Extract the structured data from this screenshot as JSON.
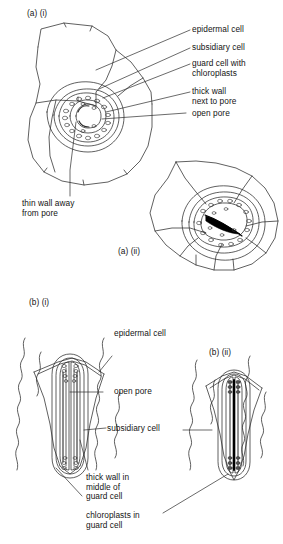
{
  "figure": {
    "panels": [
      {
        "id": "a-i",
        "code": "(a)  (i)",
        "state": "open",
        "view": "surface view of open stoma"
      },
      {
        "id": "a-ii",
        "code": "(a) (ii)",
        "state": "closed",
        "view": "surface view of closed stoma"
      },
      {
        "id": "b-i",
        "code": "(b)  (i)",
        "state": "open",
        "view": "cross-section / plan of open stoma"
      },
      {
        "id": "b-ii",
        "code": "(b)  (ii)",
        "state": "closed",
        "view": "cross-section / plan of closed stoma"
      }
    ],
    "labels": {
      "epidermal_cell": "epidermal cell",
      "subsidiary_cell": "subsidiary cell",
      "guard_cell_with_chloroplasts": "guard cell with\nchloroplasts",
      "thick_wall_next_to_pore": "thick wall\nnext to pore",
      "open_pore": "open pore",
      "thin_wall_away_from_pore": "thin wall away\nfrom pore",
      "epidermal_cell_b": "epidermal cell",
      "open_pore_b": "open pore",
      "subsidiary_cell_b": "subsidiary cell",
      "thick_wall_middle_of_guard_cell": "thick wall in\nmiddle of\nguard cell",
      "chloroplasts_in_guard_cell": "chloroplasts in\nguard cell"
    },
    "colors": {
      "ink": "#1a1a1a",
      "line": "#2b2b2b",
      "background": "#ffffff",
      "closed_pore_fill": "#000000",
      "chloroplast_stroke": "#333333"
    }
  }
}
